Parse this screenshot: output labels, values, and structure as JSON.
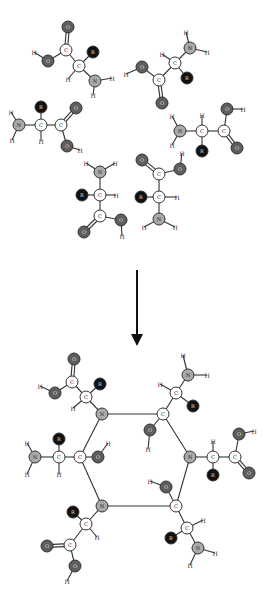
{
  "diagram": {
    "type": "chemical-reaction",
    "colors": {
      "carbon": "#ffffff",
      "nitrogen": "#a9a9a9",
      "oxygen": "#5e5e5e",
      "r_group": "#111111",
      "bond": "#333333"
    },
    "labels": {
      "C": "C",
      "N": "N",
      "O": "O",
      "R": "R",
      "H": "H"
    },
    "arrow": {
      "x": 137,
      "y1": 270,
      "y2": 340,
      "direction": "down"
    },
    "reactants": [
      {
        "id": "aa1",
        "atoms": [
          {
            "el": "O",
            "x": 68,
            "y": 27
          },
          {
            "el": "C",
            "x": 66,
            "y": 50
          },
          {
            "el": "O",
            "x": 48,
            "y": 61
          },
          {
            "el": "H",
            "x": 34,
            "y": 52
          },
          {
            "el": "C",
            "x": 79,
            "y": 66
          },
          {
            "el": "R",
            "x": 93,
            "y": 52
          },
          {
            "el": "H",
            "x": 68,
            "y": 79
          },
          {
            "el": "N",
            "x": 95,
            "y": 81
          },
          {
            "el": "H",
            "x": 112,
            "y": 78
          },
          {
            "el": "H",
            "x": 93,
            "y": 95
          }
        ],
        "bonds": [
          [
            0,
            1,
            2
          ],
          [
            1,
            2,
            1
          ],
          [
            2,
            3,
            1
          ],
          [
            1,
            4,
            1
          ],
          [
            4,
            5,
            1
          ],
          [
            4,
            6,
            1
          ],
          [
            4,
            7,
            1
          ],
          [
            7,
            8,
            1
          ],
          [
            7,
            9,
            1
          ]
        ]
      },
      {
        "id": "aa2",
        "atoms": [
          {
            "el": "H",
            "x": 186,
            "y": 32
          },
          {
            "el": "N",
            "x": 190,
            "y": 48
          },
          {
            "el": "H",
            "x": 207,
            "y": 52
          },
          {
            "el": "C",
            "x": 175,
            "y": 63
          },
          {
            "el": "H",
            "x": 162,
            "y": 54
          },
          {
            "el": "R",
            "x": 187,
            "y": 78
          },
          {
            "el": "C",
            "x": 159,
            "y": 80
          },
          {
            "el": "O",
            "x": 142,
            "y": 67
          },
          {
            "el": "H",
            "x": 126,
            "y": 74
          },
          {
            "el": "O",
            "x": 162,
            "y": 103
          }
        ],
        "bonds": [
          [
            0,
            1,
            1
          ],
          [
            1,
            2,
            1
          ],
          [
            1,
            3,
            1
          ],
          [
            3,
            4,
            1
          ],
          [
            3,
            5,
            1
          ],
          [
            3,
            6,
            1
          ],
          [
            6,
            7,
            1
          ],
          [
            7,
            8,
            1
          ],
          [
            6,
            9,
            2
          ]
        ]
      },
      {
        "id": "aa3",
        "atoms": [
          {
            "el": "H",
            "x": 11,
            "y": 112
          },
          {
            "el": "N",
            "x": 19,
            "y": 125
          },
          {
            "el": "H",
            "x": 12,
            "y": 140
          },
          {
            "el": "C",
            "x": 41,
            "y": 125
          },
          {
            "el": "R",
            "x": 41,
            "y": 107
          },
          {
            "el": "H",
            "x": 41,
            "y": 141
          },
          {
            "el": "C",
            "x": 61,
            "y": 125
          },
          {
            "el": "O",
            "x": 76,
            "y": 108
          },
          {
            "el": "O",
            "x": 67,
            "y": 146
          },
          {
            "el": "H",
            "x": 80,
            "y": 150
          }
        ],
        "bonds": [
          [
            0,
            1,
            1
          ],
          [
            1,
            2,
            1
          ],
          [
            1,
            3,
            1
          ],
          [
            3,
            4,
            1
          ],
          [
            3,
            5,
            1
          ],
          [
            3,
            6,
            1
          ],
          [
            6,
            7,
            2
          ],
          [
            6,
            8,
            1
          ],
          [
            8,
            9,
            1
          ]
        ]
      },
      {
        "id": "aa4",
        "atoms": [
          {
            "el": "H",
            "x": 172,
            "y": 116
          },
          {
            "el": "N",
            "x": 180,
            "y": 131
          },
          {
            "el": "H",
            "x": 172,
            "y": 145
          },
          {
            "el": "C",
            "x": 202,
            "y": 131
          },
          {
            "el": "H",
            "x": 202,
            "y": 115
          },
          {
            "el": "R",
            "x": 202,
            "y": 151
          },
          {
            "el": "C",
            "x": 224,
            "y": 131
          },
          {
            "el": "O",
            "x": 227,
            "y": 109
          },
          {
            "el": "H",
            "x": 243,
            "y": 109
          },
          {
            "el": "O",
            "x": 237,
            "y": 148
          }
        ],
        "bonds": [
          [
            0,
            1,
            1
          ],
          [
            1,
            2,
            1
          ],
          [
            1,
            3,
            1
          ],
          [
            3,
            4,
            1
          ],
          [
            3,
            5,
            1
          ],
          [
            3,
            6,
            1
          ],
          [
            6,
            7,
            1
          ],
          [
            7,
            8,
            1
          ],
          [
            6,
            9,
            2
          ]
        ]
      },
      {
        "id": "aa5",
        "atoms": [
          {
            "el": "H",
            "x": 86,
            "y": 163
          },
          {
            "el": "N",
            "x": 100,
            "y": 172
          },
          {
            "el": "H",
            "x": 115,
            "y": 163
          },
          {
            "el": "C",
            "x": 100,
            "y": 195
          },
          {
            "el": "R",
            "x": 82,
            "y": 195
          },
          {
            "el": "H",
            "x": 116,
            "y": 195
          },
          {
            "el": "C",
            "x": 100,
            "y": 216
          },
          {
            "el": "O",
            "x": 84,
            "y": 232
          },
          {
            "el": "O",
            "x": 121,
            "y": 220
          },
          {
            "el": "H",
            "x": 122,
            "y": 236
          }
        ],
        "bonds": [
          [
            0,
            1,
            1
          ],
          [
            1,
            2,
            1
          ],
          [
            1,
            3,
            1
          ],
          [
            3,
            4,
            1
          ],
          [
            3,
            5,
            1
          ],
          [
            3,
            6,
            1
          ],
          [
            6,
            7,
            2
          ],
          [
            6,
            8,
            1
          ],
          [
            8,
            9,
            1
          ]
        ]
      },
      {
        "id": "aa6",
        "atoms": [
          {
            "el": "O",
            "x": 142,
            "y": 160
          },
          {
            "el": "C",
            "x": 159,
            "y": 174
          },
          {
            "el": "O",
            "x": 180,
            "y": 169
          },
          {
            "el": "H",
            "x": 182,
            "y": 153
          },
          {
            "el": "C",
            "x": 159,
            "y": 197
          },
          {
            "el": "R",
            "x": 141,
            "y": 197
          },
          {
            "el": "H",
            "x": 177,
            "y": 197
          },
          {
            "el": "N",
            "x": 159,
            "y": 219
          },
          {
            "el": "H",
            "x": 144,
            "y": 227
          },
          {
            "el": "H",
            "x": 175,
            "y": 227
          }
        ],
        "bonds": [
          [
            0,
            1,
            2
          ],
          [
            1,
            2,
            1
          ],
          [
            2,
            3,
            1
          ],
          [
            1,
            4,
            1
          ],
          [
            4,
            5,
            1
          ],
          [
            4,
            6,
            1
          ],
          [
            4,
            7,
            1
          ],
          [
            7,
            8,
            1
          ],
          [
            7,
            9,
            1
          ]
        ]
      }
    ],
    "product": {
      "ring": [
        {
          "el": "N",
          "x": 102,
          "y": 414
        },
        {
          "el": "C",
          "x": 163,
          "y": 414
        },
        {
          "el": "N",
          "x": 190,
          "y": 457
        },
        {
          "el": "C",
          "x": 176,
          "y": 506
        },
        {
          "el": "N",
          "x": 102,
          "y": 506
        },
        {
          "el": "C",
          "x": 80,
          "y": 457
        }
      ],
      "substituents": [
        {
          "atoms": [
            {
              "el": "C",
              "x": 86,
              "y": 397
            },
            {
              "el": "H",
              "x": 73,
              "y": 408
            },
            {
              "el": "R",
              "x": 100,
              "y": 384
            },
            {
              "el": "C",
              "x": 72,
              "y": 382
            },
            {
              "el": "O",
              "x": 74,
              "y": 359
            },
            {
              "el": "O",
              "x": 55,
              "y": 393
            },
            {
              "el": "H",
              "x": 40,
              "y": 386
            }
          ],
          "bonds": [
            [
              "r0",
              0,
              1
            ],
            [
              0,
              1,
              1
            ],
            [
              0,
              2,
              1
            ],
            [
              0,
              3,
              1
            ],
            [
              3,
              4,
              2
            ],
            [
              3,
              5,
              1
            ],
            [
              5,
              6,
              1
            ]
          ]
        },
        {
          "atoms": [
            {
              "el": "C",
              "x": 176,
              "y": 393
            },
            {
              "el": "H",
              "x": 160,
              "y": 384
            },
            {
              "el": "R",
              "x": 193,
              "y": 406
            },
            {
              "el": "N",
              "x": 188,
              "y": 375
            },
            {
              "el": "H",
              "x": 183,
              "y": 355
            },
            {
              "el": "H",
              "x": 207,
              "y": 375
            }
          ],
          "bonds": [
            [
              "r1",
              0,
              1
            ],
            [
              0,
              1,
              1
            ],
            [
              0,
              2,
              1
            ],
            [
              0,
              3,
              1
            ],
            [
              3,
              4,
              1
            ],
            [
              3,
              5,
              1
            ]
          ]
        },
        {
          "atoms": [
            {
              "el": "O",
              "x": 150,
              "y": 430
            },
            {
              "el": "H",
              "x": 148,
              "y": 449
            }
          ],
          "bonds": [
            [
              "r1",
              0,
              1
            ],
            [
              0,
              1,
              1
            ]
          ]
        },
        {
          "atoms": [
            {
              "el": "C",
              "x": 213,
              "y": 457
            },
            {
              "el": "H",
              "x": 213,
              "y": 441
            },
            {
              "el": "R",
              "x": 213,
              "y": 475
            },
            {
              "el": "C",
              "x": 235,
              "y": 457
            },
            {
              "el": "O",
              "x": 239,
              "y": 434
            },
            {
              "el": "H",
              "x": 254,
              "y": 431
            },
            {
              "el": "O",
              "x": 249,
              "y": 473
            }
          ],
          "bonds": [
            [
              "r2",
              0,
              1
            ],
            [
              0,
              1,
              1
            ],
            [
              0,
              2,
              1
            ],
            [
              0,
              3,
              1
            ],
            [
              3,
              4,
              1
            ],
            [
              4,
              5,
              1
            ],
            [
              3,
              6,
              2
            ]
          ]
        },
        {
          "atoms": [
            {
              "el": "O",
              "x": 166,
              "y": 487
            },
            {
              "el": "H",
              "x": 150,
              "y": 481
            }
          ],
          "bonds": [
            [
              "r3",
              0,
              1
            ],
            [
              0,
              1,
              1
            ]
          ]
        },
        {
          "atoms": [
            {
              "el": "C",
              "x": 187,
              "y": 528
            },
            {
              "el": "H",
              "x": 203,
              "y": 520
            },
            {
              "el": "R",
              "x": 171,
              "y": 538
            },
            {
              "el": "N",
              "x": 198,
              "y": 548
            },
            {
              "el": "H",
              "x": 215,
              "y": 553
            },
            {
              "el": "H",
              "x": 190,
              "y": 565
            }
          ],
          "bonds": [
            [
              "r3",
              0,
              1
            ],
            [
              0,
              1,
              1
            ],
            [
              0,
              2,
              1
            ],
            [
              0,
              3,
              1
            ],
            [
              3,
              4,
              1
            ],
            [
              3,
              5,
              1
            ]
          ]
        },
        {
          "atoms": [
            {
              "el": "C",
              "x": 86,
              "y": 524
            },
            {
              "el": "H",
              "x": 97,
              "y": 537
            },
            {
              "el": "R",
              "x": 73,
              "y": 512
            },
            {
              "el": "C",
              "x": 70,
              "y": 545
            },
            {
              "el": "O",
              "x": 47,
              "y": 546
            },
            {
              "el": "O",
              "x": 75,
              "y": 566
            },
            {
              "el": "H",
              "x": 67,
              "y": 581
            }
          ],
          "bonds": [
            [
              "r4",
              0,
              1
            ],
            [
              0,
              1,
              1
            ],
            [
              0,
              2,
              1
            ],
            [
              0,
              3,
              1
            ],
            [
              3,
              4,
              2
            ],
            [
              3,
              5,
              1
            ],
            [
              5,
              6,
              1
            ]
          ]
        },
        {
          "atoms": [
            {
              "el": "C",
              "x": 59,
              "y": 457
            },
            {
              "el": "H",
              "x": 59,
              "y": 474
            },
            {
              "el": "R",
              "x": 59,
              "y": 439
            },
            {
              "el": "N",
              "x": 35,
              "y": 457
            },
            {
              "el": "H",
              "x": 27,
              "y": 443
            },
            {
              "el": "H",
              "x": 27,
              "y": 474
            }
          ],
          "bonds": [
            [
              "r5",
              0,
              1
            ],
            [
              0,
              1,
              1
            ],
            [
              0,
              2,
              1
            ],
            [
              0,
              3,
              1
            ],
            [
              3,
              4,
              1
            ],
            [
              3,
              5,
              1
            ]
          ]
        },
        {
          "atoms": [
            {
              "el": "O",
              "x": 98,
              "y": 457
            },
            {
              "el": "H",
              "x": 108,
              "y": 443
            }
          ],
          "bonds": [
            [
              "r5",
              0,
              1
            ],
            [
              0,
              1,
              1
            ]
          ]
        }
      ]
    }
  }
}
